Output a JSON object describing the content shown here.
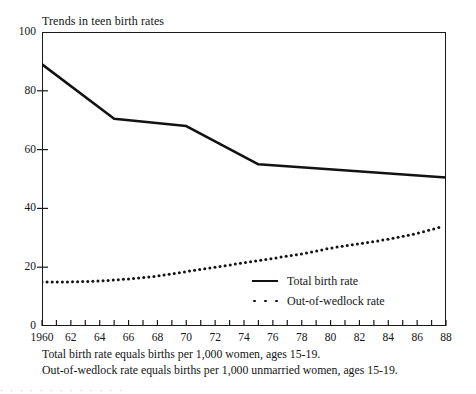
{
  "chart_data": {
    "type": "line",
    "title": "Trends in teen birth rates",
    "xlabel": "",
    "ylabel": "",
    "xlim": [
      1960,
      1988
    ],
    "ylim": [
      0,
      100
    ],
    "grid": false,
    "legend_position": "inside-lower-right",
    "y_ticks": [
      100,
      80,
      60,
      40,
      20,
      0
    ],
    "y_tick_labels": [
      "100",
      "80",
      "60",
      "40",
      "20",
      "0"
    ],
    "x_ticks": [
      1960,
      1962,
      1964,
      1966,
      1968,
      1970,
      1972,
      1974,
      1976,
      1978,
      1980,
      1982,
      1984,
      1986,
      1988
    ],
    "x_tick_labels": [
      "1960",
      "62",
      "64",
      "66",
      "68",
      "70",
      "72",
      "74",
      "76",
      "78",
      "80",
      "82",
      "84",
      "86",
      "88"
    ],
    "x_minor_tick_step": 1,
    "series": [
      {
        "name": "Total birth rate",
        "style": "solid",
        "color": "#121212",
        "x": [
          1960,
          1965,
          1970,
          1975,
          1988
        ],
        "values": [
          89,
          70.5,
          68,
          55,
          50.5
        ]
      },
      {
        "name": "Out-of-wedlock rate",
        "style": "dotted",
        "color": "#121212",
        "x": [
          1960,
          1962,
          1964,
          1966,
          1968,
          1970,
          1972,
          1974,
          1976,
          1978,
          1980,
          1982,
          1984,
          1986,
          1987.5
        ],
        "values": [
          15,
          15,
          15.3,
          16,
          17,
          18.5,
          20,
          21.5,
          23,
          24.5,
          26.5,
          28,
          29.5,
          31.5,
          33.5
        ]
      }
    ],
    "annotations": [
      "Total birth rate equals births per 1,000 women, ages 15-19.",
      "Out-of-wedlock rate equals births per 1,000 unmarried women, ages 15-19."
    ]
  },
  "legend": {
    "items": [
      {
        "label": "Total birth rate",
        "style": "solid"
      },
      {
        "label": "Out-of-wedlock rate",
        "style": "dotted"
      }
    ]
  },
  "footnotes": {
    "line1": "Total birth rate equals births per 1,000 women, ages 15-19.",
    "line2": "Out-of-wedlock rate equals births per 1,000 unmarried women, ages 15-19."
  },
  "scan_artifact": {
    "text": "· · ·   · ·  · · ·    ·  · ·   · ·"
  },
  "colors": {
    "ink": "#121212",
    "paper": "#ffffff"
  }
}
